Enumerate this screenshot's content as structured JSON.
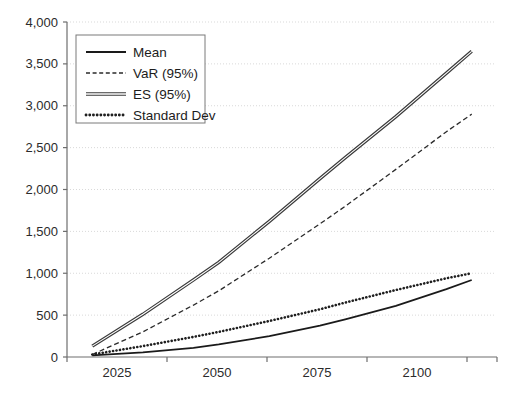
{
  "chart_data": {
    "type": "line",
    "title": "",
    "subtitle": "",
    "xlabel": "",
    "ylabel": "",
    "x": [
      2025,
      2050,
      2075,
      2100
    ],
    "xlim": [
      2020,
      2105
    ],
    "ylim": [
      0,
      4000
    ],
    "ytick_values": [
      0,
      500,
      1000,
      1500,
      2000,
      2500,
      3000,
      3500,
      4000
    ],
    "ytick_labels": [
      "0",
      "500",
      "1,000",
      "1,500",
      "2,000",
      "2,500",
      "3,000",
      "3,500",
      "4,000"
    ],
    "xtick_labels": [
      "2025",
      "2050",
      "2075",
      "2100"
    ],
    "grid": true,
    "grid_axis": "y",
    "legend_position": "upper-left",
    "series": [
      {
        "name": "Mean",
        "style": "solid",
        "color": "#1a1a1a",
        "values": [
          20,
          150,
          450,
          920
        ],
        "points": [
          {
            "x": 2025,
            "y": 20
          },
          {
            "x": 2035,
            "y": 55
          },
          {
            "x": 2045,
            "y": 110
          },
          {
            "x": 2050,
            "y": 150
          },
          {
            "x": 2060,
            "y": 250
          },
          {
            "x": 2070,
            "y": 375
          },
          {
            "x": 2075,
            "y": 450
          },
          {
            "x": 2085,
            "y": 610
          },
          {
            "x": 2095,
            "y": 810
          },
          {
            "x": 2100,
            "y": 920
          }
        ]
      },
      {
        "name": "VaR (95%)",
        "style": "dashed",
        "color": "#2a2a2a",
        "values": [
          30,
          790,
          1800,
          2900
        ],
        "points": [
          {
            "x": 2025,
            "y": 30
          },
          {
            "x": 2035,
            "y": 300
          },
          {
            "x": 2045,
            "y": 620
          },
          {
            "x": 2050,
            "y": 790
          },
          {
            "x": 2060,
            "y": 1180
          },
          {
            "x": 2070,
            "y": 1590
          },
          {
            "x": 2075,
            "y": 1800
          },
          {
            "x": 2085,
            "y": 2240
          },
          {
            "x": 2095,
            "y": 2690
          },
          {
            "x": 2100,
            "y": 2900
          }
        ]
      },
      {
        "name": "ES (95%)",
        "style": "double",
        "color": "#3a3a3a",
        "values": [
          130,
          1130,
          2380,
          3650
        ],
        "points": [
          {
            "x": 2025,
            "y": 130
          },
          {
            "x": 2035,
            "y": 510
          },
          {
            "x": 2045,
            "y": 920
          },
          {
            "x": 2050,
            "y": 1130
          },
          {
            "x": 2060,
            "y": 1620
          },
          {
            "x": 2070,
            "y": 2130
          },
          {
            "x": 2075,
            "y": 2380
          },
          {
            "x": 2085,
            "y": 2870
          },
          {
            "x": 2095,
            "y": 3390
          },
          {
            "x": 2100,
            "y": 3650
          }
        ]
      },
      {
        "name": "Standard Dev",
        "style": "dotted",
        "color": "#1f1f1f",
        "values": [
          30,
          300,
          650,
          1000
        ],
        "points": [
          {
            "x": 2025,
            "y": 30
          },
          {
            "x": 2035,
            "y": 130
          },
          {
            "x": 2045,
            "y": 240
          },
          {
            "x": 2050,
            "y": 300
          },
          {
            "x": 2060,
            "y": 430
          },
          {
            "x": 2070,
            "y": 570
          },
          {
            "x": 2075,
            "y": 650
          },
          {
            "x": 2085,
            "y": 800
          },
          {
            "x": 2095,
            "y": 940
          },
          {
            "x": 2100,
            "y": 1000
          }
        ]
      }
    ]
  },
  "legend": {
    "items": [
      {
        "label": "Mean",
        "swatch": "solid-line-swatch"
      },
      {
        "label": "VaR (95%)",
        "swatch": "dashed-line-swatch"
      },
      {
        "label": "ES (95%)",
        "swatch": "double-line-swatch"
      },
      {
        "label": "Standard Dev",
        "swatch": "dotted-line-swatch"
      }
    ]
  },
  "colors": {
    "background": "#ffffff",
    "grid": "#d9d9d9",
    "axis": "#6e6e6e",
    "text": "#2b2b2b"
  }
}
